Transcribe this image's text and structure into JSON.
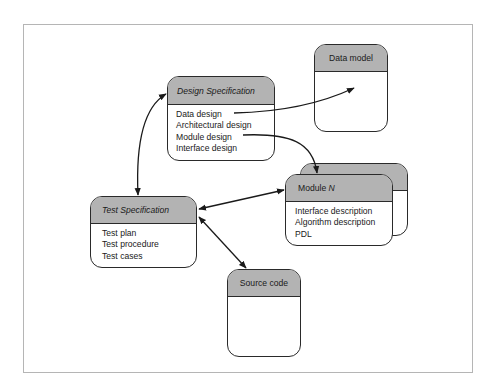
{
  "diagram": {
    "nodes": {
      "design_spec": {
        "title": "Design Specification",
        "items": [
          "Data design",
          "Architectural design",
          "Module design",
          "Interface design"
        ]
      },
      "data_model": {
        "title": "Data model",
        "items": []
      },
      "module_n": {
        "title_prefix": "Module ",
        "title_var": "N",
        "items": [
          "Interface description",
          "Algorithm description",
          "PDL"
        ]
      },
      "test_spec": {
        "title": "Test Specification",
        "items": [
          "Test plan",
          "Test procedure",
          "Test cases"
        ]
      },
      "source_code": {
        "title": "Source code",
        "items": []
      }
    },
    "edges": [
      {
        "from": "Data design",
        "to": "Data model",
        "direction": "forward"
      },
      {
        "from": "Module design",
        "to": "Module N",
        "direction": "forward"
      },
      {
        "from": "Design Specification",
        "to": "Test Specification",
        "direction": "both"
      },
      {
        "from": "Test Specification",
        "to": "Module N",
        "direction": "both"
      },
      {
        "from": "Test Specification",
        "to": "Source code",
        "direction": "both"
      }
    ],
    "colors": {
      "header_fill": "#b3b3b3",
      "stroke": "#2a2a2a",
      "frame": "#b5b5b5"
    }
  }
}
